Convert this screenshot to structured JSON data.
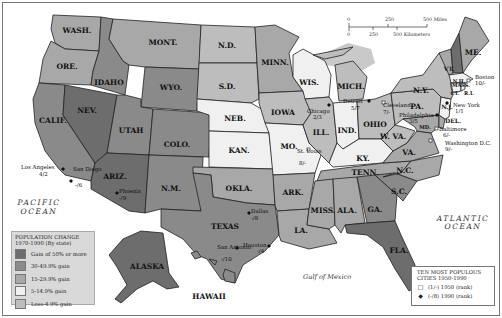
{
  "map": {
    "colors": {
      "gain_50_plus": "#6d6d6d",
      "gain_30_49": "#8a8a8a",
      "gain_15_29": "#a8a8a8",
      "gain_5_14": "#f0f0f0",
      "loss_4_gain": "#bdbdbd",
      "lakes": "#c9c9c9"
    },
    "states": [
      {
        "abbr": "WASH.",
        "class": "gain_15_29"
      },
      {
        "abbr": "ORE.",
        "class": "gain_15_29"
      },
      {
        "abbr": "CALIF.",
        "class": "gain_30_49"
      },
      {
        "abbr": "NEV.",
        "class": "gain_50_plus"
      },
      {
        "abbr": "IDAHO",
        "class": "gain_30_49"
      },
      {
        "abbr": "MONT.",
        "class": "gain_15_29"
      },
      {
        "abbr": "WYO.",
        "class": "gain_30_49"
      },
      {
        "abbr": "UTAH",
        "class": "gain_30_49"
      },
      {
        "abbr": "ARIZ.",
        "class": "gain_50_plus"
      },
      {
        "abbr": "COLO.",
        "class": "gain_30_49"
      },
      {
        "abbr": "N.M.",
        "class": "gain_30_49"
      },
      {
        "abbr": "N.D.",
        "class": "loss_4_gain"
      },
      {
        "abbr": "S.D.",
        "class": "loss_4_gain"
      },
      {
        "abbr": "NEB.",
        "class": "gain_5_14"
      },
      {
        "abbr": "KAN.",
        "class": "gain_5_14"
      },
      {
        "abbr": "OKLA.",
        "class": "gain_15_29"
      },
      {
        "abbr": "TEXAS",
        "class": "gain_30_49"
      },
      {
        "abbr": "MINN.",
        "class": "gain_15_29"
      },
      {
        "abbr": "IOWA",
        "class": "loss_4_gain"
      },
      {
        "abbr": "MO.",
        "class": "gain_5_14"
      },
      {
        "abbr": "ARK.",
        "class": "gain_15_29"
      },
      {
        "abbr": "LA.",
        "class": "gain_15_29"
      },
      {
        "abbr": "WIS.",
        "class": "gain_5_14"
      },
      {
        "abbr": "ILL.",
        "class": "loss_4_gain"
      },
      {
        "abbr": "MICH.",
        "class": "loss_4_gain"
      },
      {
        "abbr": "IND.",
        "class": "gain_5_14"
      },
      {
        "abbr": "OHIO",
        "class": "loss_4_gain"
      },
      {
        "abbr": "KY.",
        "class": "gain_5_14"
      },
      {
        "abbr": "TENN.",
        "class": "gain_15_29"
      },
      {
        "abbr": "MISS.",
        "class": "gain_15_29"
      },
      {
        "abbr": "ALA.",
        "class": "gain_15_29"
      },
      {
        "abbr": "GA.",
        "class": "gain_30_49"
      },
      {
        "abbr": "FLA.",
        "class": "gain_50_plus"
      },
      {
        "abbr": "S.C.",
        "class": "gain_30_49"
      },
      {
        "abbr": "N.C.",
        "class": "gain_15_29"
      },
      {
        "abbr": "VA.",
        "class": "gain_15_29"
      },
      {
        "abbr": "W. VA.",
        "class": "loss_4_gain"
      },
      {
        "abbr": "PA.",
        "class": "loss_4_gain"
      },
      {
        "abbr": "N.Y.",
        "class": "loss_4_gain"
      },
      {
        "abbr": "VT.",
        "class": "gain_15_29"
      },
      {
        "abbr": "N.H.",
        "class": "gain_50_plus"
      },
      {
        "abbr": "ME.",
        "class": "gain_15_29"
      },
      {
        "abbr": "MASS.",
        "class": "gain_5_14"
      },
      {
        "abbr": "CT.",
        "class": "gain_5_14"
      },
      {
        "abbr": "R.I.",
        "class": "gain_5_14"
      },
      {
        "abbr": "N.J.",
        "class": "gain_5_14"
      },
      {
        "abbr": "DEL.",
        "class": "gain_15_29"
      },
      {
        "abbr": "MD.",
        "class": "gain_15_29"
      },
      {
        "abbr": "ALASKA",
        "class": "gain_50_plus"
      },
      {
        "abbr": "HAWAII",
        "class": "gain_30_49"
      }
    ],
    "cities": [
      {
        "name": "Los Angeles",
        "rank": "4/2"
      },
      {
        "name": "San Diego",
        "rank": "-/6"
      },
      {
        "name": "Phoenix",
        "rank": "-/9"
      },
      {
        "name": "Dallas",
        "rank": "-/8"
      },
      {
        "name": "San Antonio",
        "rank": "-/10"
      },
      {
        "name": "Houston",
        "rank": "-/4"
      },
      {
        "name": "St. Louis",
        "rank": "8/-"
      },
      {
        "name": "Chicago",
        "rank": "2/3"
      },
      {
        "name": "Detroit",
        "rank": "5/7"
      },
      {
        "name": "Cleveland",
        "rank": "7/-"
      },
      {
        "name": "Philadelphia",
        "rank": "3/5"
      },
      {
        "name": "New York",
        "rank": "1/1"
      },
      {
        "name": "Boston",
        "rank": "10/-"
      },
      {
        "name": "Baltimore",
        "rank": "6/-"
      },
      {
        "name": "Washington D.C.",
        "rank": "9/-"
      }
    ],
    "water": {
      "pacific": [
        "PACIFIC",
        "OCEAN"
      ],
      "atlantic": [
        "ATLANTIC",
        "OCEAN"
      ],
      "gulf": "Gulf of Mexico"
    },
    "scale": {
      "miles": [
        "0",
        "250",
        "500 Miles"
      ],
      "km": [
        "0",
        "250",
        "500 Kilometers"
      ]
    }
  },
  "legend_population": {
    "title": "POPULATION CHANGE",
    "subtitle": "1970-1990 (By state)",
    "items": [
      {
        "label": "Gain of 50% or more",
        "color": "#6d6d6d"
      },
      {
        "label": "30-49.9% gain",
        "color": "#8a8a8a"
      },
      {
        "label": "15-29.9% gain",
        "color": "#a8a8a8"
      },
      {
        "label": "5-14.9% gain",
        "color": "#f0f0f0"
      },
      {
        "label": "Loss-4.9% gain",
        "color": "#bdbdbd"
      }
    ]
  },
  "legend_cities": {
    "title": "TEN MOST POPULOUS CITIES 1950-1990",
    "items": [
      {
        "icon": "□",
        "label": "(1/-) 1950 (rank)"
      },
      {
        "icon": "◆",
        "label": "(-/8) 1990 (rank)"
      }
    ]
  }
}
